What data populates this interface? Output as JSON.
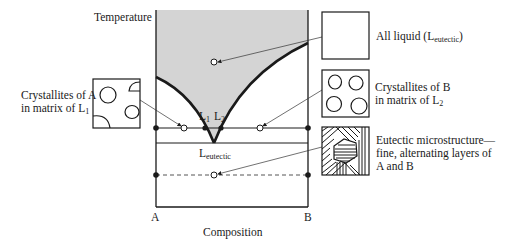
{
  "diagram": {
    "axes": {
      "y_label": "Temperature",
      "x_label": "Composition",
      "x_left": "A",
      "x_right": "B"
    },
    "phase_labels": {
      "l1": {
        "base": "L",
        "sub": "1"
      },
      "l2": {
        "base": "L",
        "sub": "2"
      },
      "eutectic": {
        "base": "L",
        "sub": "eutectic"
      }
    },
    "callouts": {
      "liquid": {
        "text": "All liquid (",
        "base": "L",
        "sub": "eutectic",
        "close": ")"
      },
      "crystallites_a": {
        "line1": "Crystallites of A",
        "line2_pre": "in matrix of ",
        "base": "L",
        "sub": "1"
      },
      "crystallites_b": {
        "line1": "Crystallites of B",
        "line2_pre": "in matrix of ",
        "base": "L",
        "sub": "2"
      },
      "eutectic_micro": {
        "line1": "Eutectic microstructure—",
        "line2": "fine, alternating layers of",
        "line3": "A and B"
      }
    },
    "colors": {
      "liquid_region": "#d4d4d4",
      "line": "#1a1a1a"
    }
  }
}
